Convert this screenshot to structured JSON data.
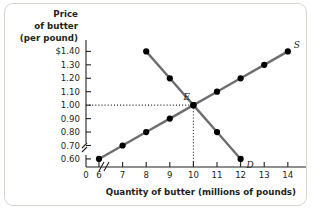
{
  "chart_data": {
    "type": "line",
    "title": "",
    "ylabel_lines": [
      "Price",
      "of butter",
      "(per pound)"
    ],
    "xlabel": "Quantity of butter (millions of pounds)",
    "xlim": [
      5.45,
      14.6
    ],
    "ylim": [
      0.54,
      1.455
    ],
    "grid": false,
    "legend_position": "inline-curve-end",
    "x_origin_label": "0",
    "x_axis_break": true,
    "y_axis_break": true,
    "xticks": [
      6,
      7,
      8,
      9,
      10,
      11,
      12,
      13,
      14
    ],
    "xtick_labels": [
      "6",
      "7",
      "8",
      "9",
      "10",
      "11",
      "12",
      "13",
      "14"
    ],
    "yticks": [
      0.6,
      0.7,
      0.8,
      0.9,
      1.0,
      1.1,
      1.2,
      1.3,
      1.4
    ],
    "ytick_labels": [
      "0.60",
      "0.70",
      "0.80",
      "0.90",
      "1.00",
      "1.10",
      "1.20",
      "1.30",
      "$1.40"
    ],
    "series": [
      {
        "name": "S",
        "label": "S",
        "description": "Supply curve for butter",
        "color": "#6d6e71",
        "x": [
          6,
          7,
          8,
          9,
          10,
          11,
          12,
          13,
          14
        ],
        "y": [
          0.6,
          0.7,
          0.8,
          0.9,
          1.0,
          1.1,
          1.2,
          1.3,
          1.4
        ]
      },
      {
        "name": "D",
        "label": "D",
        "description": "Demand curve for butter",
        "color": "#6d6e71",
        "x": [
          8,
          9,
          10,
          11,
          12
        ],
        "y": [
          1.4,
          1.2,
          1.0,
          0.8,
          0.6
        ]
      }
    ],
    "annotations": [
      {
        "name": "equilibrium",
        "label": "E",
        "x": 10,
        "y": 1.0,
        "guide_lines": [
          "horizontal-to-y-axis",
          "vertical-to-x-axis"
        ]
      }
    ],
    "colors": {
      "curve": "#6d6e71",
      "point": "#000000",
      "axis": "#231f20",
      "text": "#231f20",
      "border": "#d8d5cf",
      "background": "#ffffff"
    }
  }
}
